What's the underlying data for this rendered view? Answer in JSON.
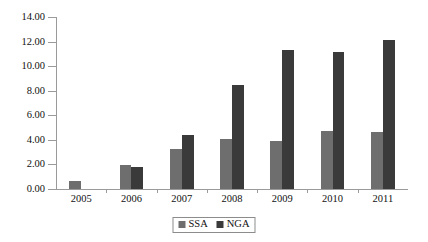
{
  "chart_data": {
    "type": "bar",
    "title": "",
    "subtitle": "",
    "xlabel": "",
    "ylabel": "",
    "categories": [
      "2005",
      "2006",
      "2007",
      "2008",
      "2009",
      "2010",
      "2011"
    ],
    "series": [
      {
        "name": "SSA",
        "color": "#6e6e6e",
        "values": [
          0.65,
          1.95,
          3.25,
          4.05,
          3.92,
          4.72,
          4.62
        ]
      },
      {
        "name": "NGA",
        "color": "#3a3a3a",
        "values": [
          0,
          1.78,
          4.42,
          8.48,
          11.32,
          11.15,
          12.15
        ]
      }
    ],
    "ylim": [
      0,
      14
    ],
    "ytick_step": 2,
    "ytick_labels": [
      "0.00",
      "2.00",
      "4.00",
      "6.00",
      "8.00",
      "10.00",
      "12.00",
      "14.00"
    ],
    "ytick_values": [
      0,
      2,
      4,
      6,
      8,
      10,
      12,
      14
    ],
    "grid": false,
    "legend_position": "bottom-center",
    "legend_entries": [
      "SSA",
      "NGA"
    ]
  }
}
